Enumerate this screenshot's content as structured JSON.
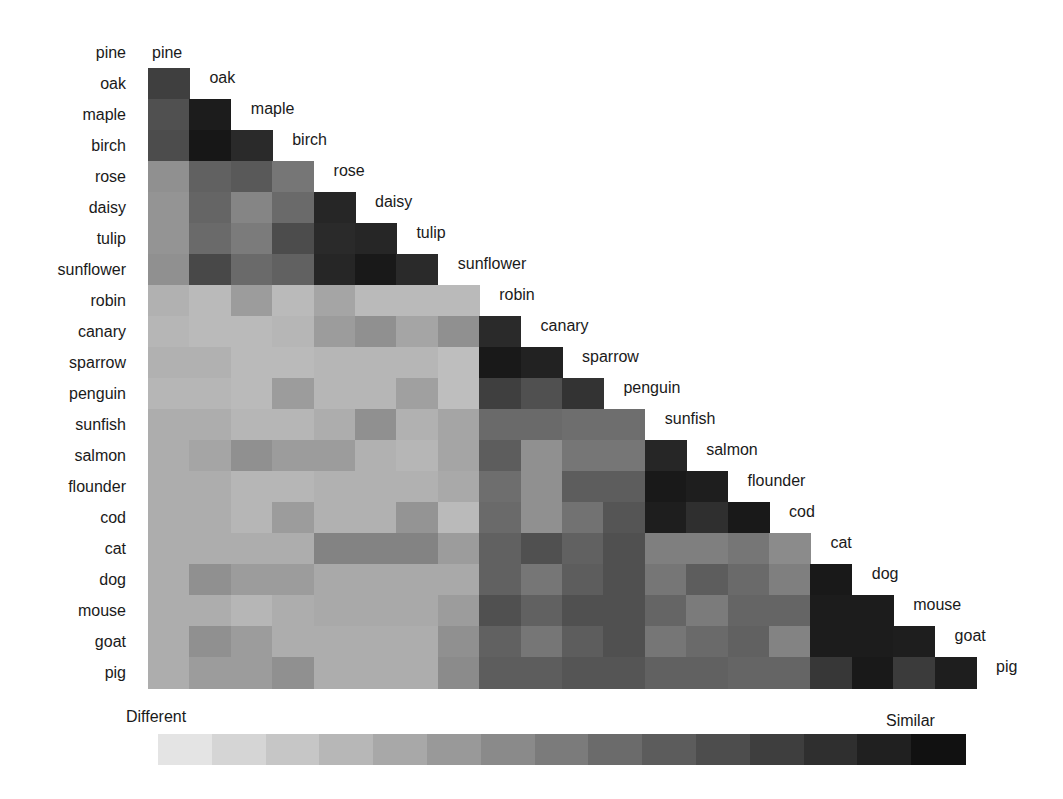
{
  "chart_data": {
    "type": "heatmap",
    "title": "",
    "subtitle": "",
    "layout": "lower-triangular similarity matrix, diagonal labels to the right of each row's last cell, grid off",
    "labels": [
      "pine",
      "oak",
      "maple",
      "birch",
      "rose",
      "daisy",
      "tulip",
      "sunflower",
      "robin",
      "canary",
      "sparrow",
      "penguin",
      "sunfish",
      "salmon",
      "flounder",
      "cod",
      "cat",
      "dog",
      "mouse",
      "goat",
      "pig"
    ],
    "value_range": [
      0,
      1
    ],
    "colorbar": {
      "orientation": "horizontal",
      "low_label": "Different",
      "high_label": "Similar",
      "steps": 15,
      "low_color": "#e4e4e4",
      "high_color": "#111111"
    },
    "matrix_lower": [
      [],
      [
        0.78
      ],
      [
        0.7,
        0.95
      ],
      [
        0.72,
        0.97,
        0.88
      ],
      [
        0.4,
        0.62,
        0.66,
        0.52
      ],
      [
        0.38,
        0.6,
        0.45,
        0.58,
        0.9
      ],
      [
        0.38,
        0.58,
        0.5,
        0.72,
        0.88,
        0.9
      ],
      [
        0.4,
        0.74,
        0.58,
        0.62,
        0.9,
        0.96,
        0.88
      ],
      [
        0.24,
        0.2,
        0.34,
        0.2,
        0.3,
        0.2,
        0.2,
        0.2
      ],
      [
        0.22,
        0.2,
        0.2,
        0.22,
        0.34,
        0.4,
        0.3,
        0.4,
        0.88
      ],
      [
        0.24,
        0.24,
        0.2,
        0.2,
        0.22,
        0.22,
        0.22,
        0.18,
        0.96,
        0.92
      ],
      [
        0.22,
        0.22,
        0.2,
        0.34,
        0.22,
        0.22,
        0.32,
        0.18,
        0.78,
        0.7,
        0.84
      ],
      [
        0.26,
        0.26,
        0.22,
        0.22,
        0.26,
        0.4,
        0.24,
        0.3,
        0.58,
        0.58,
        0.56,
        0.56
      ],
      [
        0.26,
        0.3,
        0.4,
        0.34,
        0.34,
        0.24,
        0.22,
        0.3,
        0.64,
        0.4,
        0.52,
        0.52,
        0.9
      ],
      [
        0.26,
        0.26,
        0.22,
        0.22,
        0.24,
        0.24,
        0.24,
        0.28,
        0.56,
        0.4,
        0.64,
        0.64,
        0.96,
        0.94
      ],
      [
        0.26,
        0.26,
        0.22,
        0.34,
        0.24,
        0.24,
        0.38,
        0.2,
        0.58,
        0.4,
        0.54,
        0.68,
        0.94,
        0.86,
        0.96
      ],
      [
        0.26,
        0.26,
        0.26,
        0.26,
        0.46,
        0.46,
        0.46,
        0.34,
        0.62,
        0.7,
        0.62,
        0.7,
        0.48,
        0.48,
        0.52,
        0.42
      ],
      [
        0.26,
        0.4,
        0.34,
        0.34,
        0.28,
        0.28,
        0.28,
        0.28,
        0.62,
        0.52,
        0.64,
        0.7,
        0.52,
        0.64,
        0.58,
        0.48,
        0.96
      ],
      [
        0.26,
        0.26,
        0.22,
        0.26,
        0.28,
        0.28,
        0.28,
        0.34,
        0.7,
        0.62,
        0.7,
        0.7,
        0.6,
        0.5,
        0.6,
        0.6,
        0.95,
        0.95
      ],
      [
        0.26,
        0.4,
        0.34,
        0.26,
        0.26,
        0.26,
        0.26,
        0.4,
        0.62,
        0.52,
        0.64,
        0.7,
        0.52,
        0.58,
        0.62,
        0.46,
        0.95,
        0.95,
        0.94
      ],
      [
        0.26,
        0.34,
        0.34,
        0.4,
        0.26,
        0.26,
        0.26,
        0.42,
        0.64,
        0.64,
        0.68,
        0.68,
        0.62,
        0.62,
        0.6,
        0.6,
        0.82,
        0.96,
        0.8,
        0.94
      ]
    ]
  }
}
